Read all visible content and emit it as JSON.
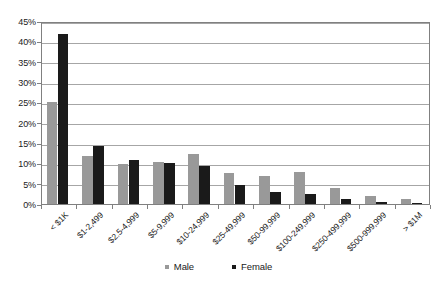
{
  "chart_data": {
    "type": "bar",
    "title": "",
    "subtitle": "",
    "xlabel": "",
    "ylabel": "",
    "ylim": [
      0,
      45
    ],
    "ytick_step": 5,
    "ytick_labels": [
      "0%",
      "5%",
      "10%",
      "15%",
      "20%",
      "25%",
      "30%",
      "35%",
      "40%",
      "45%"
    ],
    "ytick_values": [
      0,
      5,
      10,
      15,
      20,
      25,
      30,
      35,
      40,
      45
    ],
    "grid": true,
    "grid_axis": "y",
    "legend_position": "bottom-center",
    "categories": [
      "< $1K",
      "$1-2,499",
      "$2.5-4,999",
      "$5-9,999",
      "$10-24,999",
      "$25-49,999",
      "$50-99,999",
      "$100-249,999",
      "$250-499,999",
      "$500-999,999",
      "> $1M"
    ],
    "series": [
      {
        "name": "Male",
        "color": "#999999",
        "values": [
          25.0,
          11.7,
          9.9,
          10.3,
          12.2,
          7.6,
          6.8,
          7.8,
          4.0,
          1.9,
          1.2
        ]
      },
      {
        "name": "Female",
        "color": "#1a1a1a",
        "values": [
          41.8,
          14.3,
          10.8,
          10.1,
          9.4,
          4.6,
          3.0,
          2.4,
          1.2,
          0.6,
          0.25
        ]
      }
    ]
  },
  "colors": {
    "male": "#999999",
    "female": "#1a1a1a",
    "gridline": "#a6a6a6",
    "axis": "#808080",
    "text": "#1a1a1a",
    "background": "#ffffff"
  }
}
